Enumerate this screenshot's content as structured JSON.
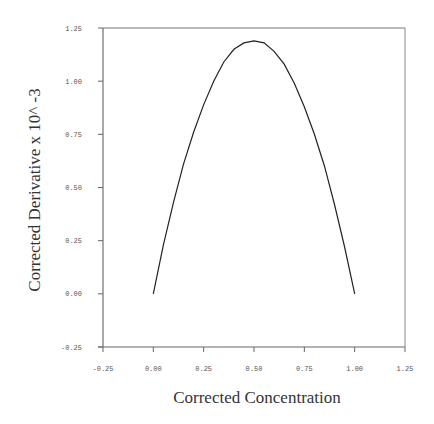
{
  "chart_data": {
    "type": "line",
    "title": "",
    "xlabel": "Corrected Concentration",
    "ylabel": "Corrected Derivative x 10^ -3",
    "xlim": [
      -0.25,
      1.25
    ],
    "ylim": [
      -0.25,
      1.25
    ],
    "x_ticks": [
      "-0.25",
      "0.00",
      "0.25",
      "0.50",
      "0.75",
      "1.00",
      "1.25"
    ],
    "y_ticks": [
      "-0.25",
      "0.00",
      "0.25",
      "0.50",
      "0.75",
      "1.00",
      "1.25"
    ],
    "grid": false,
    "legend": null,
    "series": [
      {
        "name": "derivative",
        "x": [
          0.0,
          0.05,
          0.1,
          0.15,
          0.2,
          0.25,
          0.3,
          0.35,
          0.4,
          0.45,
          0.5,
          0.55,
          0.6,
          0.65,
          0.7,
          0.75,
          0.8,
          0.85,
          0.9,
          0.95,
          1.0
        ],
        "y": [
          0.0,
          0.23,
          0.43,
          0.61,
          0.76,
          0.89,
          1.0,
          1.09,
          1.15,
          1.18,
          1.19,
          1.18,
          1.14,
          1.08,
          0.99,
          0.88,
          0.75,
          0.6,
          0.42,
          0.22,
          0.0
        ]
      }
    ]
  },
  "labels": {
    "xlabel": "Corrected Concentration",
    "ylabel": "Corrected Derivative x 10^ -3"
  }
}
